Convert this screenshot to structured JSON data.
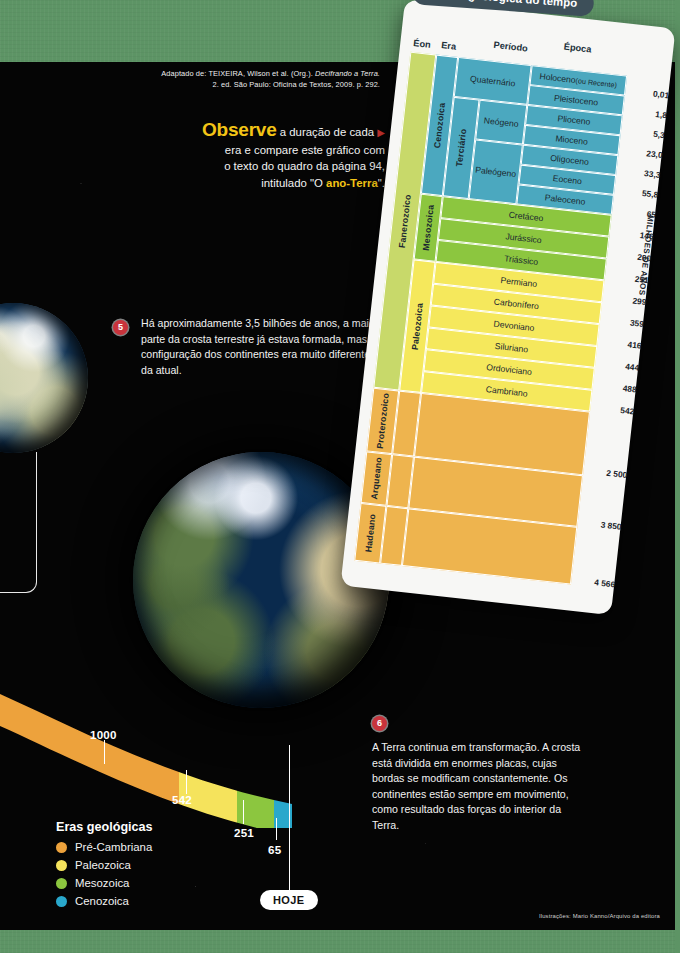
{
  "page": {
    "background_color": "#5d9465",
    "plate_color": "#050505"
  },
  "source": {
    "line1_prefix": "Adaptado de: TEIXEIRA, Wilson et al. (Org.). ",
    "line1_italic": "Decifrando a Terra.",
    "line2": "2. ed. São Paulo: Oficina de Textos, 2009. p. 292."
  },
  "observe": {
    "bold_word": "Observe",
    "rest_line1": " a duração de cada",
    "line2": "era e compare este gráfico com",
    "line3": "o texto do quadro da página 94,",
    "line4_prefix": "intitulado \"O ",
    "line4_bold": "ano-Terra",
    "line4_suffix": "\"."
  },
  "callouts": [
    {
      "number": "5",
      "text": "Há aproximadamente 3,5 bilhões de anos, a maior parte da crosta terrestre já estava formada, mas a configuração dos continentes era muito diferente da atual."
    },
    {
      "number": "6",
      "text": "A Terra continua em transformação. A crosta está dividida em enormes placas, cujas bordas se modificam constantemente. Os continentes estão sempre em movimento, como resultado das forças do interior da Terra."
    }
  ],
  "timeline": {
    "markers": [
      "1000",
      "542",
      "251",
      "65"
    ],
    "today_label": "HOJE",
    "colors": {
      "precambrian": "#eda23c",
      "paleozoic": "#f5e35c",
      "mesozoic": "#8cc63f",
      "cenozoic": "#29a8cc"
    }
  },
  "legend": {
    "title": "Eras geológicas",
    "items": [
      {
        "label": "Pré-Cambriana",
        "color": "#eda23c"
      },
      {
        "label": "Paleozoica",
        "color": "#f5e35c"
      },
      {
        "label": "Mesozoica",
        "color": "#8cc63f"
      },
      {
        "label": "Cenozoica",
        "color": "#29a8cc"
      }
    ]
  },
  "credit": "Ilustrações: Mario Kanno/Arquivo da editora",
  "chart_data": {
    "type": "table",
    "title": "Escala geológica do tempo",
    "axis_label": "MILHÕES DE ANOS",
    "columns": [
      "Éon",
      "Era",
      "Período",
      "Época"
    ],
    "colors": {
      "eon_fanerozoico": "#c8d96a",
      "eon_precambrian": "#eeb44e",
      "cenozoic": "#4ba8bf",
      "mesozoic": "#8cc63f",
      "paleozoic": "#f5e85c",
      "precambrian": "#eeb44e"
    },
    "eons": [
      {
        "name": "Fanerozoico",
        "color": "#c8d96a"
      },
      {
        "name": "Proterozoico",
        "color": "#eeb44e"
      },
      {
        "name": "Arqueano",
        "color": "#eeb44e"
      },
      {
        "name": "Hadeano",
        "color": "#eeb44e"
      }
    ],
    "rows": [
      {
        "era": "Cenozoica",
        "periodo": "Quaternário",
        "sub": "",
        "epoca": "Holoceno (ou Recente)",
        "age": "0,01",
        "color": "#4ba8bf"
      },
      {
        "era": "Cenozoica",
        "periodo": "Quaternário",
        "sub": "",
        "epoca": "Pleistoceno",
        "age": "1,8",
        "color": "#4ba8bf"
      },
      {
        "era": "Cenozoica",
        "periodo": "Terciário",
        "sub": "Neógeno",
        "epoca": "Plioceno",
        "age": "5,3",
        "color": "#4ba8bf"
      },
      {
        "era": "Cenozoica",
        "periodo": "Terciário",
        "sub": "Neógeno",
        "epoca": "Mioceno",
        "age": "23,0",
        "color": "#4ba8bf"
      },
      {
        "era": "Cenozoica",
        "periodo": "Terciário",
        "sub": "Paleógeno",
        "epoca": "Oligoceno",
        "age": "33,3",
        "color": "#4ba8bf"
      },
      {
        "era": "Cenozoica",
        "periodo": "Terciário",
        "sub": "Paleógeno",
        "epoca": "Eoceno",
        "age": "55,8",
        "color": "#4ba8bf"
      },
      {
        "era": "Cenozoica",
        "periodo": "Terciário",
        "sub": "Paleógeno",
        "epoca": "Paleoceno",
        "age": "65",
        "color": "#4ba8bf"
      },
      {
        "era": "Mesozoica",
        "periodo": "Cretáceo",
        "sub": "",
        "epoca": "",
        "age": "146",
        "color": "#8cc63f"
      },
      {
        "era": "Mesozoica",
        "periodo": "Jurássico",
        "sub": "",
        "epoca": "",
        "age": "200",
        "color": "#8cc63f"
      },
      {
        "era": "Mesozoica",
        "periodo": "Triássico",
        "sub": "",
        "epoca": "",
        "age": "251",
        "color": "#8cc63f"
      },
      {
        "era": "Paleozoica",
        "periodo": "Permiano",
        "sub": "",
        "epoca": "",
        "age": "299",
        "color": "#f5e85c"
      },
      {
        "era": "Paleozoica",
        "periodo": "Carbonífero",
        "sub": "",
        "epoca": "",
        "age": "359",
        "color": "#f5e85c"
      },
      {
        "era": "Paleozoica",
        "periodo": "Devoniano",
        "sub": "",
        "epoca": "",
        "age": "416",
        "color": "#f5e85c"
      },
      {
        "era": "Paleozoica",
        "periodo": "Siluriano",
        "sub": "",
        "epoca": "",
        "age": "444",
        "color": "#f5e85c"
      },
      {
        "era": "Paleozoica",
        "periodo": "Ordoviciano",
        "sub": "",
        "epoca": "",
        "age": "488",
        "color": "#f5e85c"
      },
      {
        "era": "Paleozoica",
        "periodo": "Cambriano",
        "sub": "",
        "epoca": "",
        "age": "542",
        "color": "#f5e85c"
      },
      {
        "era": "",
        "periodo": "",
        "sub": "",
        "epoca": "",
        "age": "2 500",
        "color": "#eeb44e"
      },
      {
        "era": "",
        "periodo": "",
        "sub": "",
        "epoca": "",
        "age": "3 850",
        "color": "#eeb44e"
      },
      {
        "era": "",
        "periodo": "",
        "sub": "",
        "epoca": "",
        "age": "4 566",
        "color": "#eeb44e"
      }
    ]
  }
}
